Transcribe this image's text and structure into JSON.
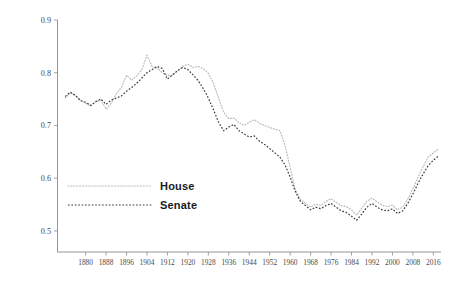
{
  "chart_data": {
    "type": "line",
    "title": "",
    "xlabel": "",
    "ylabel": "",
    "xlim": [
      1869,
      2019
    ],
    "ylim": [
      0.46,
      0.9
    ],
    "grid": false,
    "legend_position": "center-left",
    "y_ticks": [
      "0.9",
      "0.8",
      "0.7",
      "0.6",
      "0.5"
    ],
    "y_tick_values": [
      0.9,
      0.8,
      0.7,
      0.6,
      0.5
    ],
    "x_ticks": [
      "1880",
      "1888",
      "1896",
      "1904",
      "1912",
      "1920",
      "1928",
      "1936",
      "1944",
      "1952",
      "1960",
      "1968",
      "1976",
      "1984",
      "1992",
      "2000",
      "2008",
      "2016"
    ],
    "x_tick_values": [
      1880,
      1888,
      1896,
      1904,
      1912,
      1920,
      1928,
      1936,
      1944,
      1952,
      1960,
      1968,
      1976,
      1984,
      1992,
      2000,
      2008,
      2016
    ],
    "series": [
      {
        "name": "House",
        "color": "#b9b9b9",
        "style": "dotted",
        "x": [
          1872,
          1874,
          1876,
          1878,
          1880,
          1882,
          1884,
          1886,
          1888,
          1890,
          1892,
          1894,
          1896,
          1898,
          1900,
          1902,
          1904,
          1906,
          1908,
          1910,
          1912,
          1914,
          1916,
          1918,
          1920,
          1922,
          1924,
          1926,
          1928,
          1930,
          1932,
          1934,
          1936,
          1938,
          1940,
          1942,
          1944,
          1946,
          1948,
          1950,
          1952,
          1954,
          1956,
          1958,
          1960,
          1962,
          1964,
          1966,
          1968,
          1970,
          1972,
          1974,
          1976,
          1978,
          1980,
          1982,
          1984,
          1986,
          1988,
          1990,
          1992,
          1994,
          1996,
          1998,
          2000,
          2002,
          2004,
          2006,
          2008,
          2010,
          2012,
          2014,
          2016,
          2018
        ],
        "values": [
          0.752,
          0.762,
          0.757,
          0.748,
          0.742,
          0.737,
          0.746,
          0.748,
          0.731,
          0.742,
          0.76,
          0.772,
          0.795,
          0.786,
          0.794,
          0.806,
          0.833,
          0.812,
          0.809,
          0.8,
          0.795,
          0.795,
          0.804,
          0.812,
          0.816,
          0.81,
          0.812,
          0.808,
          0.799,
          0.78,
          0.752,
          0.725,
          0.713,
          0.714,
          0.705,
          0.7,
          0.706,
          0.711,
          0.704,
          0.7,
          0.696,
          0.693,
          0.69,
          0.662,
          0.62,
          0.578,
          0.56,
          0.552,
          0.545,
          0.551,
          0.548,
          0.556,
          0.561,
          0.554,
          0.548,
          0.546,
          0.54,
          0.53,
          0.543,
          0.556,
          0.562,
          0.555,
          0.549,
          0.546,
          0.549,
          0.54,
          0.545,
          0.56,
          0.58,
          0.602,
          0.622,
          0.64,
          0.648,
          0.655
        ]
      },
      {
        "name": "Senate",
        "color": "#3c3c3c",
        "style": "dashed",
        "x": [
          1872,
          1874,
          1876,
          1878,
          1880,
          1882,
          1884,
          1886,
          1888,
          1890,
          1892,
          1894,
          1896,
          1898,
          1900,
          1902,
          1904,
          1906,
          1908,
          1910,
          1912,
          1914,
          1916,
          1918,
          1920,
          1922,
          1924,
          1926,
          1928,
          1930,
          1932,
          1934,
          1936,
          1938,
          1940,
          1942,
          1944,
          1946,
          1948,
          1950,
          1952,
          1954,
          1956,
          1958,
          1960,
          1962,
          1964,
          1966,
          1968,
          1970,
          1972,
          1974,
          1976,
          1978,
          1980,
          1982,
          1984,
          1986,
          1988,
          1990,
          1992,
          1994,
          1996,
          1998,
          2000,
          2002,
          2004,
          2006,
          2008,
          2010,
          2012,
          2014,
          2016,
          2018
        ],
        "values": [
          0.755,
          0.763,
          0.757,
          0.747,
          0.744,
          0.738,
          0.745,
          0.75,
          0.74,
          0.748,
          0.752,
          0.756,
          0.765,
          0.772,
          0.78,
          0.79,
          0.8,
          0.806,
          0.812,
          0.808,
          0.788,
          0.796,
          0.804,
          0.81,
          0.806,
          0.796,
          0.785,
          0.77,
          0.752,
          0.73,
          0.706,
          0.69,
          0.697,
          0.702,
          0.69,
          0.684,
          0.678,
          0.68,
          0.67,
          0.664,
          0.656,
          0.648,
          0.64,
          0.625,
          0.602,
          0.575,
          0.556,
          0.548,
          0.54,
          0.545,
          0.542,
          0.548,
          0.552,
          0.545,
          0.538,
          0.535,
          0.528,
          0.52,
          0.532,
          0.545,
          0.552,
          0.545,
          0.54,
          0.538,
          0.542,
          0.533,
          0.538,
          0.552,
          0.57,
          0.59,
          0.608,
          0.624,
          0.634,
          0.642
        ]
      }
    ]
  },
  "legend": {
    "items": [
      {
        "label": "House",
        "swatch": "dotted-light-line"
      },
      {
        "label": "Senate",
        "swatch": "dashed-dark-line"
      }
    ]
  },
  "axes": {
    "y_axis_name": "value-axis",
    "x_axis_name": "year-axis"
  }
}
